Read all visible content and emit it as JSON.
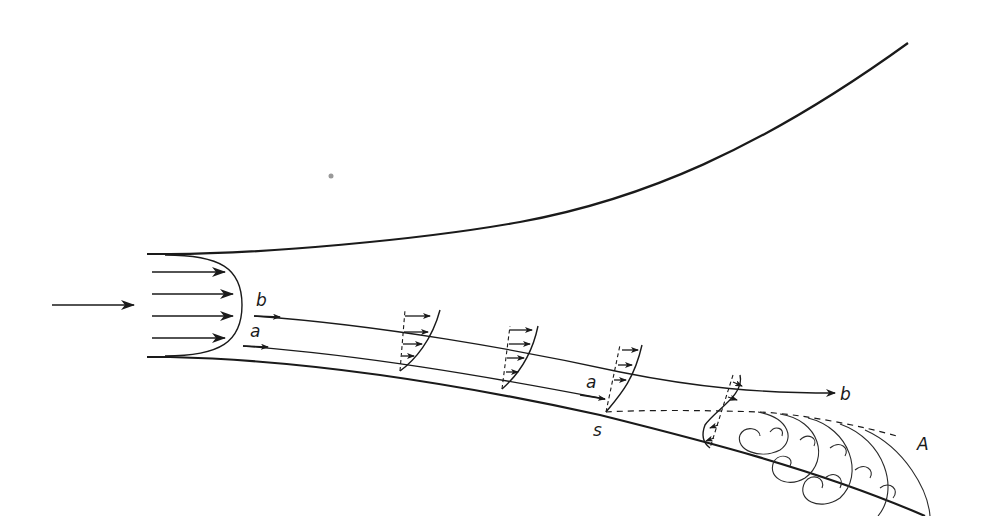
{
  "figure": {
    "labels": {
      "streamline_b_start": "b",
      "streamline_a_start": "a",
      "streamline_a_end": "a",
      "streamline_b_end": "b",
      "separation_point": "s",
      "separated_region": "A"
    },
    "elements": [
      "inflow-arrow",
      "uniform-inlet-velocity-profile",
      "upper-wall",
      "lower-wall",
      "streamline-a",
      "streamline-b",
      "boundary-layer-velocity-profiles",
      "separation-streamline",
      "recirculation-eddies"
    ],
    "colors": {
      "ink": "#1a1a1a",
      "background": "#ffffff"
    }
  }
}
